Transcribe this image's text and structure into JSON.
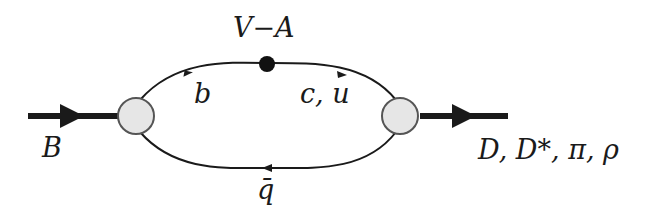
{
  "diagram": {
    "type": "feynman-diagram",
    "labels": {
      "incoming": "B",
      "vertex": "V−A",
      "quark_b": "b",
      "quark_cu": "c, u",
      "antiquark": "q̄",
      "outgoing": "D, D*, π, ρ"
    },
    "colors": {
      "line": "#1a1a1a",
      "blob_fill": "#e6e6e6",
      "blob_stroke": "#555555",
      "vertex_dot": "#111111"
    }
  }
}
